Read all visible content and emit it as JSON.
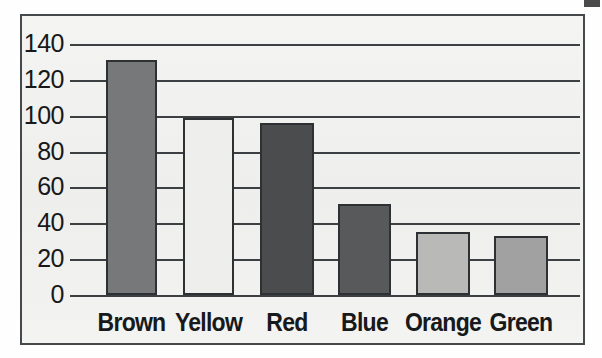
{
  "figure": {
    "frame_color": "#45494c",
    "background_color": "#f2f2f0"
  },
  "chart_data": {
    "type": "bar",
    "title": "",
    "subtitle": "",
    "xlabel": "",
    "ylabel": "",
    "categories": [
      "Brown",
      "Yellow",
      "Red",
      "Blue",
      "Orange",
      "Green"
    ],
    "values": [
      131,
      99,
      96,
      51,
      35,
      33
    ],
    "bar_colors": [
      "#77787a",
      "#eeeeec",
      "#4a4c4e",
      "#58595b",
      "#b9bab8",
      "#a0a1a0"
    ],
    "bar_edge_color": "#2e3133",
    "ylim": [
      0,
      140
    ],
    "ytick_values": [
      0,
      20,
      40,
      60,
      80,
      100,
      120,
      140
    ],
    "ytick_labels": [
      "0",
      "20",
      "40",
      "60",
      "80",
      "100",
      "120",
      "140"
    ],
    "grid": true,
    "grid_axis": "y",
    "grid_color": "#3c4043",
    "legend": false,
    "legend_position": "none",
    "annotations": []
  },
  "axes": {
    "y_axis_name": "y-axis",
    "x_axis_name": "x-axis"
  }
}
